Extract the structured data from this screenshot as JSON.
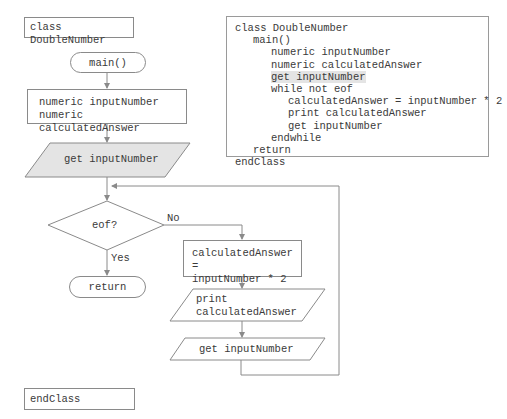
{
  "flowchart": {
    "class_box": "class DoubleNumber",
    "main_terminal": "main()",
    "declarations": [
      "numeric inputNumber",
      "numeric calculatedAnswer"
    ],
    "priming_input": "get inputNumber",
    "decision": "eof?",
    "decision_no_label": "No",
    "decision_yes_label": "Yes",
    "return_terminal": "return",
    "calculation": [
      "calculatedAnswer =",
      "inputNumber * 2"
    ],
    "output": [
      "print",
      "calculatedAnswer"
    ],
    "loop_input": "get inputNumber",
    "end_class_box": "endClass"
  },
  "pseudocode": {
    "lines": [
      {
        "indent": 0,
        "text": "class DoubleNumber",
        "highlight": false
      },
      {
        "indent": 1,
        "text": "main()",
        "highlight": false
      },
      {
        "indent": 2,
        "text": "numeric inputNumber",
        "highlight": false
      },
      {
        "indent": 2,
        "text": "numeric calculatedAnswer",
        "highlight": false
      },
      {
        "indent": 2,
        "text": "get inputNumber",
        "highlight": true
      },
      {
        "indent": 2,
        "text": "while not eof",
        "highlight": false
      },
      {
        "indent": 3,
        "text": "calculatedAnswer = inputNumber * 2",
        "highlight": false
      },
      {
        "indent": 3,
        "text": "print calculatedAnswer",
        "highlight": false
      },
      {
        "indent": 3,
        "text": "get inputNumber",
        "highlight": false
      },
      {
        "indent": 2,
        "text": "endwhile",
        "highlight": false
      },
      {
        "indent": 1,
        "text": "return",
        "highlight": false
      },
      {
        "indent": 0,
        "text": "endClass",
        "highlight": false
      }
    ]
  },
  "colors": {
    "stroke": "#8a8a8a",
    "highlight_fill": "#e4e4e4",
    "text": "#3a3a3a"
  }
}
